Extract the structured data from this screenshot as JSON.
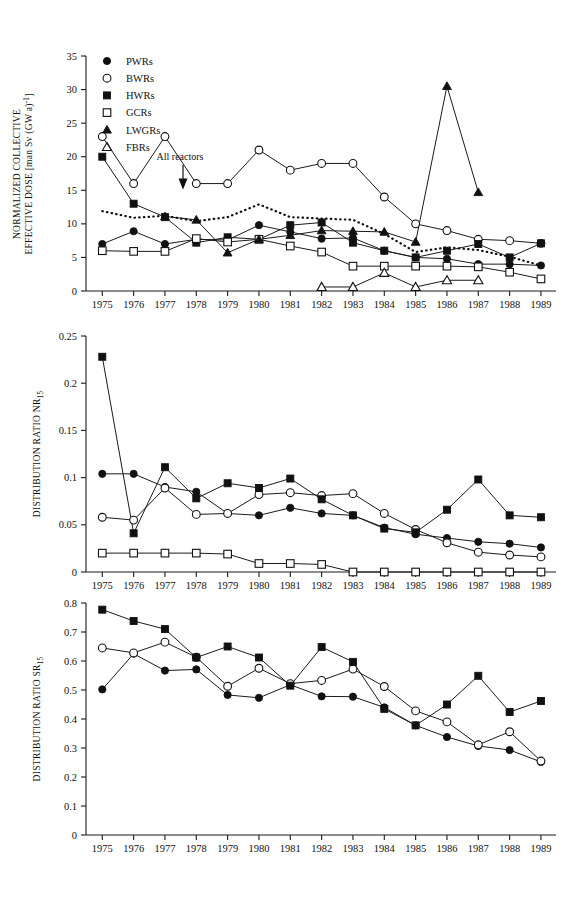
{
  "figure": {
    "series_legend": [
      {
        "key": "PWRs",
        "label": "PWRs",
        "marker": "filled-circle"
      },
      {
        "key": "BWRs",
        "label": "BWRs",
        "marker": "open-circle"
      },
      {
        "key": "HWRs",
        "label": "HWRs",
        "marker": "filled-square"
      },
      {
        "key": "GCRs",
        "label": "GCRs",
        "marker": "open-square"
      },
      {
        "key": "LWGRs",
        "label": "LWGRs",
        "marker": "filled-triangle"
      },
      {
        "key": "FBRs",
        "label": "FBRs",
        "marker": "open-triangle"
      }
    ],
    "annotation": {
      "text": "All  reactors"
    },
    "years": [
      1975,
      1976,
      1977,
      1978,
      1979,
      1980,
      1981,
      1982,
      1983,
      1984,
      1985,
      1986,
      1987,
      1988,
      1989
    ]
  },
  "chart_data": [
    {
      "id": "normalized-collective-effective-dose",
      "type": "line",
      "title": "",
      "xlabel": "",
      "ylabel": "NORMALIZED COLLECTIVE EFFECTIVE DOSE [man Sv (GW a)-1]",
      "ylabel_parts": {
        "line1": "NORMALIZED  COLLECTIVE",
        "line2": "EFFECTIVE  DOSE  [man  Sv  (GW  a)",
        "line2_sup": "-1",
        "line2_tail": "]"
      },
      "categories": [
        "1975",
        "1976",
        "1977",
        "1978",
        "1979",
        "1980",
        "1981",
        "1982",
        "1983",
        "1984",
        "1985",
        "1986",
        "1987",
        "1988",
        "1989"
      ],
      "x": [
        1975,
        1976,
        1977,
        1978,
        1979,
        1980,
        1981,
        1982,
        1983,
        1984,
        1985,
        1986,
        1987,
        1988,
        1989
      ],
      "ylim": [
        0,
        35
      ],
      "yticks": [
        0,
        5,
        10,
        15,
        20,
        25,
        30,
        35
      ],
      "yticklabels": [
        "0",
        "5",
        "10",
        "15",
        "20",
        "25",
        "30",
        "35"
      ],
      "grid": false,
      "legend_position": "top-left-inside",
      "series": [
        {
          "name": "PWRs",
          "marker": "filled-circle",
          "values": [
            7.0,
            8.9,
            7.0,
            7.7,
            7.6,
            9.8,
            8.8,
            7.8,
            7.9,
            6.0,
            5.0,
            4.8,
            4.0,
            4.0,
            3.8
          ]
        },
        {
          "name": "BWRs",
          "marker": "open-circle",
          "values": [
            23.0,
            16.0,
            23.0,
            16.0,
            16.0,
            21.0,
            18.0,
            19.0,
            19.0,
            14.0,
            10.0,
            9.0,
            7.7,
            7.5,
            7.1
          ]
        },
        {
          "name": "HWRs",
          "marker": "filled-square",
          "values": [
            20.0,
            13.0,
            11.0,
            7.2,
            8.0,
            7.7,
            9.8,
            10.2,
            7.2,
            6.0,
            5.0,
            6.0,
            7.0,
            5.0,
            7.1
          ]
        },
        {
          "name": "GCRs",
          "marker": "open-square",
          "values": [
            6.0,
            5.9,
            5.9,
            7.8,
            7.3,
            7.7,
            6.7,
            5.8,
            3.7,
            3.7,
            3.7,
            3.7,
            3.6,
            2.8,
            1.8
          ]
        },
        {
          "name": "LWGRs",
          "marker": "filled-triangle",
          "values": [
            null,
            null,
            11.1,
            10.6,
            5.7,
            7.7,
            8.3,
            9.0,
            8.9,
            8.8,
            7.3,
            30.5,
            14.7,
            null,
            null
          ]
        },
        {
          "name": "FBRs",
          "marker": "open-triangle",
          "values": [
            null,
            null,
            null,
            null,
            null,
            null,
            null,
            0.6,
            0.6,
            2.7,
            0.6,
            1.6,
            1.6,
            null,
            null
          ]
        },
        {
          "name": "All reactors",
          "marker": "none",
          "style": "dotted",
          "values": [
            11.9,
            10.9,
            11.2,
            10.4,
            11.0,
            12.9,
            11.0,
            10.8,
            10.6,
            8.5,
            5.8,
            6.5,
            6.1,
            5.1,
            3.8
          ]
        }
      ]
    },
    {
      "id": "distribution-ratio-nr15",
      "type": "line",
      "title": "",
      "xlabel": "",
      "ylabel": "DISTRIBUTION RATIO NR15",
      "ylabel_parts": {
        "main": "DISTRIBUTION  RATIO  NR",
        "sub": "15"
      },
      "categories": [
        "1975",
        "1976",
        "1977",
        "1978",
        "1979",
        "1980",
        "1981",
        "1982",
        "1983",
        "1984",
        "1985",
        "1986",
        "1987",
        "1988",
        "1989"
      ],
      "x": [
        1975,
        1976,
        1977,
        1978,
        1979,
        1980,
        1981,
        1982,
        1983,
        1984,
        1985,
        1986,
        1987,
        1988,
        1989
      ],
      "ylim": [
        0,
        0.25
      ],
      "yticks": [
        0,
        0.05,
        0.1,
        0.15,
        0.2,
        0.25
      ],
      "yticklabels": [
        "0",
        "0.05",
        "0.1",
        "0.15",
        "0.2",
        "0.25"
      ],
      "grid": false,
      "legend_position": "none",
      "series": [
        {
          "name": "PWRs",
          "marker": "filled-circle",
          "values": [
            0.104,
            0.104,
            0.09,
            0.085,
            0.062,
            0.06,
            0.068,
            0.062,
            0.06,
            0.047,
            0.04,
            0.036,
            0.032,
            0.03,
            0.026
          ]
        },
        {
          "name": "BWRs",
          "marker": "open-circle",
          "values": [
            0.058,
            0.055,
            0.089,
            0.061,
            0.062,
            0.082,
            0.084,
            0.081,
            0.083,
            0.062,
            0.045,
            0.031,
            0.021,
            0.018,
            0.016
          ]
        },
        {
          "name": "HWRs",
          "marker": "filled-square",
          "values": [
            0.228,
            0.041,
            0.111,
            0.078,
            0.094,
            0.089,
            0.099,
            0.077,
            0.06,
            0.046,
            0.042,
            0.066,
            0.098,
            0.06,
            0.058
          ]
        },
        {
          "name": "GCRs",
          "marker": "open-square",
          "values": [
            0.02,
            0.02,
            0.02,
            0.02,
            0.019,
            0.009,
            0.009,
            0.008,
            0.0,
            0.0,
            0.0,
            0.0,
            0.0,
            0.0,
            0.0
          ]
        }
      ]
    },
    {
      "id": "distribution-ratio-sr15",
      "type": "line",
      "title": "",
      "xlabel": "",
      "ylabel": "DISTRIBUTION RATIO SR15",
      "ylabel_parts": {
        "main": "DISTRIBUTION  RATIO  SR",
        "sub": "15"
      },
      "categories": [
        "1975",
        "1976",
        "1977",
        "1978",
        "1979",
        "1980",
        "1981",
        "1982",
        "1983",
        "1984",
        "1985",
        "1986",
        "1987",
        "1988",
        "1989"
      ],
      "x": [
        1975,
        1976,
        1977,
        1978,
        1979,
        1980,
        1981,
        1982,
        1983,
        1984,
        1985,
        1986,
        1987,
        1988,
        1989
      ],
      "ylim": [
        0,
        0.8
      ],
      "yticks": [
        0,
        0.1,
        0.2,
        0.3,
        0.4,
        0.5,
        0.6,
        0.7,
        0.8
      ],
      "yticklabels": [
        "0",
        "0.1",
        "0.2",
        "0.3",
        "0.4",
        "0.5",
        "0.6",
        "0.7",
        "0.8"
      ],
      "grid": false,
      "legend_position": "none",
      "series": [
        {
          "name": "PWRs",
          "marker": "filled-circle",
          "values": [
            0.502,
            0.625,
            0.567,
            0.571,
            0.483,
            0.473,
            0.518,
            0.478,
            0.477,
            0.44,
            0.378,
            0.338,
            0.307,
            0.293,
            0.252
          ]
        },
        {
          "name": "BWRs",
          "marker": "open-circle",
          "values": [
            0.645,
            0.628,
            0.665,
            0.613,
            0.513,
            0.575,
            0.522,
            0.533,
            0.572,
            0.512,
            0.428,
            0.39,
            0.311,
            0.356,
            0.255
          ]
        },
        {
          "name": "HWRs",
          "marker": "filled-square",
          "values": [
            0.777,
            0.738,
            0.71,
            0.612,
            0.65,
            0.612,
            0.515,
            0.648,
            0.597,
            0.435,
            0.378,
            0.45,
            0.549,
            0.424,
            0.462
          ]
        }
      ]
    }
  ]
}
